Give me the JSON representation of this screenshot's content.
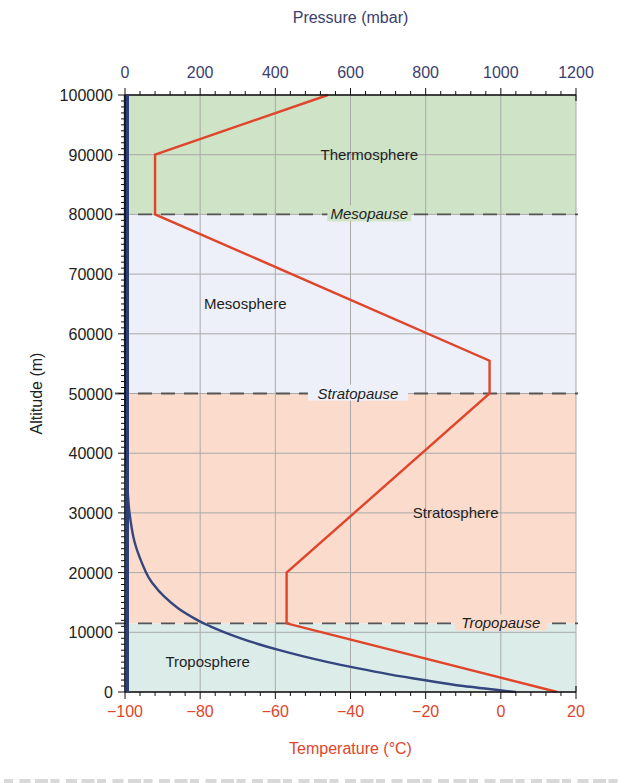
{
  "chart_data": {
    "type": "line",
    "title": "",
    "ylabel": "Altitude (m)",
    "ylim": [
      0,
      100000
    ],
    "yticks": [
      "0",
      "10000",
      "20000",
      "30000",
      "40000",
      "50000",
      "60000",
      "70000",
      "80000",
      "90000",
      "100000"
    ],
    "x_bottom": {
      "label": "Temperature (°C)",
      "range": [
        -100,
        20
      ],
      "ticks": [
        "−100",
        "−80",
        "−60",
        "−40",
        "−20",
        "0",
        "20"
      ],
      "color": "#e0452c"
    },
    "x_top": {
      "label": "Pressure (mbar)",
      "range": [
        0,
        1200
      ],
      "ticks": [
        "0",
        "200",
        "400",
        "600",
        "800",
        "1000",
        "1200"
      ],
      "color": "#3b3e6e"
    },
    "grid": true,
    "series": [
      {
        "name": "Temperature",
        "axis": "bottom",
        "color": "#e0452c",
        "points": [
          {
            "x": 15,
            "y": 0
          },
          {
            "x": -57,
            "y": 11500
          },
          {
            "x": -57,
            "y": 20000
          },
          {
            "x": -3,
            "y": 50000
          },
          {
            "x": -3,
            "y": 55500
          },
          {
            "x": -92,
            "y": 80000
          },
          {
            "x": -92,
            "y": 90000
          },
          {
            "x": -46,
            "y": 100000
          }
        ]
      },
      {
        "name": "Pressure",
        "axis": "top",
        "color": "#34457f",
        "points": [
          {
            "x": 1040,
            "y": 0
          },
          {
            "x": 900,
            "y": 1000
          },
          {
            "x": 795,
            "y": 2000
          },
          {
            "x": 700,
            "y": 3000
          },
          {
            "x": 617,
            "y": 4000
          },
          {
            "x": 540,
            "y": 5000
          },
          {
            "x": 472,
            "y": 6000
          },
          {
            "x": 411,
            "y": 7000
          },
          {
            "x": 356,
            "y": 8000
          },
          {
            "x": 308,
            "y": 9000
          },
          {
            "x": 265,
            "y": 10000
          },
          {
            "x": 227,
            "y": 11000
          },
          {
            "x": 194,
            "y": 12000
          },
          {
            "x": 142,
            "y": 14000
          },
          {
            "x": 104,
            "y": 16000
          },
          {
            "x": 76,
            "y": 18000
          },
          {
            "x": 56,
            "y": 20000
          },
          {
            "x": 26,
            "y": 25000
          },
          {
            "x": 12,
            "y": 30000
          },
          {
            "x": 6,
            "y": 35000
          },
          {
            "x": 3,
            "y": 40000
          },
          {
            "x": 1.5,
            "y": 45000
          },
          {
            "x": 0.8,
            "y": 50000
          },
          {
            "x": 0.2,
            "y": 60000
          },
          {
            "x": 0.05,
            "y": 70000
          },
          {
            "x": 0.01,
            "y": 80000
          },
          {
            "x": 0,
            "y": 100000
          }
        ]
      }
    ],
    "regions": [
      {
        "name": "Troposphere",
        "from": 0,
        "to": 11500,
        "color": "#dcede9",
        "label_x": -78,
        "label_y": 5000
      },
      {
        "name": "Stratosphere",
        "from": 11500,
        "to": 50000,
        "color": "#fbdccc",
        "label_x": -12,
        "label_y": 30000
      },
      {
        "name": "Mesosphere",
        "from": 50000,
        "to": 80000,
        "color": "#edf0f8",
        "label_x": -68,
        "label_y": 65000
      },
      {
        "name": "Thermosphere",
        "from": 80000,
        "to": 100000,
        "color": "#cfe3c6",
        "label_x": -35,
        "label_y": 90000
      }
    ],
    "boundaries": [
      {
        "name": "Tropopause",
        "altitude": 11500,
        "label_x": 0
      },
      {
        "name": "Stratopause",
        "altitude": 50000,
        "label_x": -38
      },
      {
        "name": "Mesopause",
        "altitude": 80000,
        "label_x": -35
      }
    ]
  }
}
